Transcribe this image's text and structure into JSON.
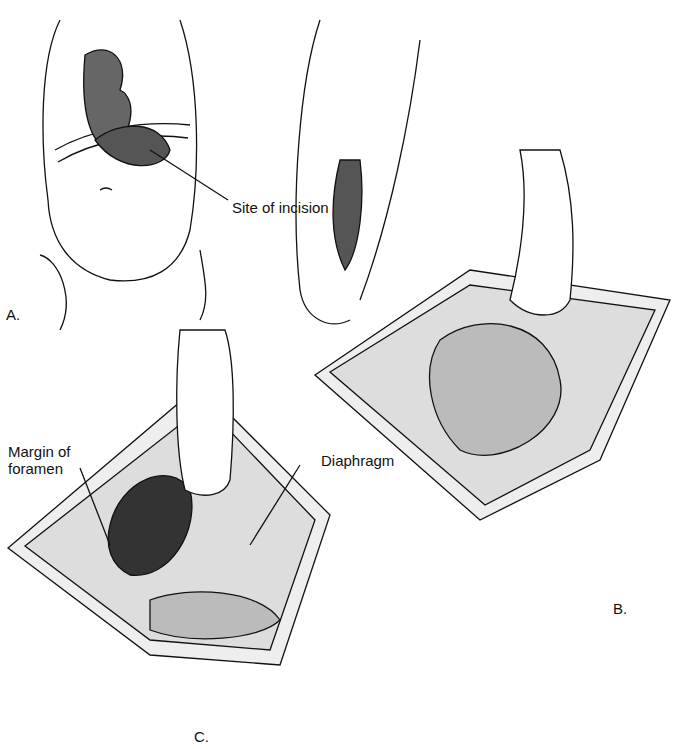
{
  "figure": {
    "panels": [
      {
        "id": "A",
        "label": "A.",
        "description": "Infant torso front and side views showing site of incision"
      },
      {
        "id": "B",
        "label": "B.",
        "description": "Opened abdomen with retractor and intestines"
      },
      {
        "id": "C",
        "label": "C.",
        "description": "Opened abdomen showing diaphragm and foramen"
      }
    ],
    "annotations": {
      "site_of_incision": "Site of incision",
      "margin_of_foramen": "Margin of\nforamen",
      "diaphragm": "Diaphragm"
    }
  }
}
